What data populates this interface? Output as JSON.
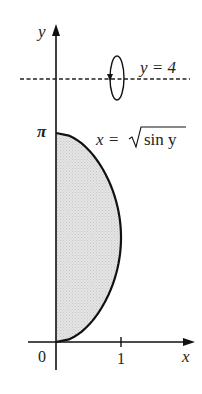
{
  "figure": {
    "type": "region-rotation-diagram",
    "axes": {
      "x_label": "x",
      "y_label": "y",
      "origin_label": "0",
      "x_tick_label": "1",
      "y_tick_label": "π"
    },
    "curve": {
      "equation_lhs": "x =",
      "equation_radical": "sin y",
      "description": "x = √(sin y)",
      "domain_y": [
        0,
        3.14159
      ]
    },
    "axis_of_rotation": {
      "label": "y = 4",
      "style": "dashed",
      "value": 4
    },
    "rotation_indicator": "circular-arrow",
    "shaded_region": {
      "fill_color": "#dcdcdc",
      "bounds": "between y-axis and x = √(sin y), 0 ≤ y ≤ π"
    },
    "colors": {
      "stroke": "#111111",
      "fill": "#dcdcdc",
      "background": "#ffffff"
    }
  }
}
